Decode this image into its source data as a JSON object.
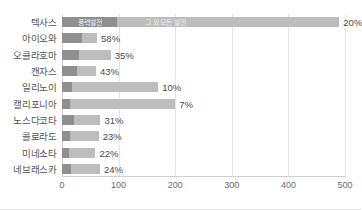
{
  "chart_data": {
    "type": "bar",
    "orientation": "horizontal",
    "stacked": true,
    "title": "",
    "subtitle": "",
    "xlabel": "",
    "ylabel": "",
    "xlim": [
      0,
      500
    ],
    "xticks": [
      "0",
      "100",
      "200",
      "300",
      "400",
      "500"
    ],
    "xtick_values": [
      0,
      100,
      200,
      300,
      400,
      500
    ],
    "grid": true,
    "grid_axis": "x",
    "legend_position": "inline-first-bar",
    "categories": [
      "텍사스",
      "아이오와",
      "오클라호마",
      "캔자스",
      "일리노이",
      "캘리포니아",
      "노스다코타",
      "콜로라도",
      "미네소타",
      "네브래스카"
    ],
    "series": [
      {
        "name": "풍력발전",
        "color": "#8f8f8f",
        "values": [
          98,
          36,
          30,
          26,
          17,
          14,
          21,
          15,
          13,
          16
        ]
      },
      {
        "name": "그 외 모든 발전",
        "color": "#bdbdbd",
        "values": [
          392,
          26,
          56,
          34,
          153,
          186,
          47,
          50,
          46,
          51
        ]
      }
    ],
    "totals": [
      490,
      62,
      86,
      60,
      170,
      200,
      68,
      65,
      59,
      67
    ],
    "data_labels": [
      "20%",
      "58%",
      "35%",
      "43%",
      "10%",
      "7%",
      "31%",
      "23%",
      "22%",
      "24%"
    ],
    "data_label_values": [
      20,
      58,
      35,
      43,
      10,
      7,
      31,
      23,
      22,
      24
    ],
    "data_label_meaning": "풍력발전 점유율"
  },
  "legend": {
    "items": [
      {
        "label": "풍력발전",
        "color": "#8f8f8f"
      },
      {
        "label": "그 외 모든 발전",
        "color": "#bdbdbd"
      }
    ]
  },
  "colors": {
    "wind": "#8f8f8f",
    "other": "#bdbdbd",
    "grid": "#e3e3e3",
    "axis": "#cfcfcf",
    "category_text": "#555555",
    "tick_text": "#6b6b6b",
    "label_text": "#4a4a4a",
    "background": "#ffffff"
  }
}
